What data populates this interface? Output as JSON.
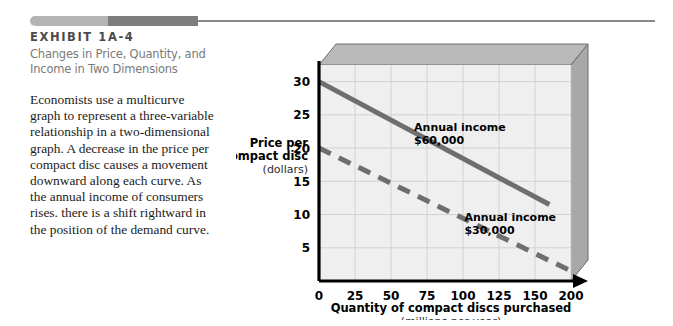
{
  "exhibit": {
    "title": "EXHIBIT 1A-4",
    "subtitle_line1": "Changes in Price, Quantity, and",
    "subtitle_line2": "Income in Two Dimensions",
    "body": "Economists use a multicurve graph to represent a three-variable relationship in a two-dimensional graph. A decrease in the price per compact disc causes a movement downward along each curve. As the annual income of consumers rises. there is a shift rightward in the position of the demand curve."
  },
  "colors": {
    "curve_60k": "#6e6e6e",
    "curve_30k": "#6e6e6e",
    "plot_background": "#efefef",
    "box_top": "#b9b9b9",
    "box_side": "#a8a8a8",
    "grid": "#d2d2d2",
    "axis": "#000000",
    "header_light": "#b4b4b4",
    "header_dark": "#7d7d7d"
  },
  "chart_data": {
    "type": "line",
    "title": "Changes in Price, Quantity, and Income in Two Dimensions",
    "xlabel": "Quantity of compact discs purchased",
    "xlabel_units": "(millions per year)",
    "ylabel": "Price per compact disc",
    "ylabel_units": "(dollars)",
    "xlim": [
      0,
      175
    ],
    "ylim": [
      0,
      32.5
    ],
    "xticks": [
      "0",
      "25",
      "50",
      "75",
      "100",
      "125",
      "150",
      "200"
    ],
    "xtick_values": [
      0,
      25,
      50,
      75,
      100,
      125,
      150,
      175
    ],
    "yticks": [
      "5",
      "10",
      "15",
      "20",
      "25",
      "30"
    ],
    "ytick_values": [
      5,
      10,
      15,
      20,
      25,
      30
    ],
    "grid": true,
    "legend_position": "inline-annotation",
    "series": [
      {
        "name": "Annual income $60,000",
        "label_line1": "Annual income",
        "label_line2": "$60,000",
        "style": "solid",
        "x": [
          0,
          160
        ],
        "y": [
          30,
          11.5
        ]
      },
      {
        "name": "Annual income $30,000",
        "label_line1": "Annual income",
        "label_line2": "$30,000",
        "style": "dashed",
        "x": [
          0,
          175
        ],
        "y": [
          20,
          1.5
        ]
      }
    ]
  }
}
